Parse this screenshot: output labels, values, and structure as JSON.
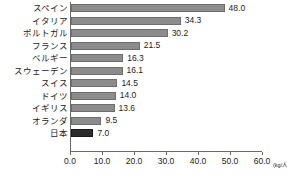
{
  "chart_data": {
    "type": "bar",
    "orientation": "horizontal",
    "title": "",
    "subtitle": "",
    "xlabel": "",
    "ylabel": "",
    "unit_label": "(kg/人/年)",
    "categories": [
      "スペイン",
      "イタリア",
      "ポルトガル",
      "フランス",
      "ベルギー",
      "スウェーデン",
      "スイス",
      "ドイツ",
      "イギリス",
      "オランダ",
      "日本"
    ],
    "values": [
      48.0,
      34.3,
      30.2,
      21.5,
      16.3,
      16.1,
      14.5,
      14.0,
      13.6,
      9.5,
      7.0
    ],
    "value_labels": [
      "48.0",
      "34.3",
      "30.2",
      "21.5",
      "16.3",
      "16.1",
      "14.5",
      "14.0",
      "13.6",
      "9.5",
      "7.0"
    ],
    "highlight_category": "日本",
    "xlim": [
      0,
      60
    ],
    "xticks": [
      0,
      10,
      20,
      30,
      40,
      50,
      60
    ],
    "xtick_labels": [
      "0.0",
      "10.0",
      "20.0",
      "30.0",
      "40.0",
      "50.0",
      "60.0"
    ],
    "grid": false,
    "legend": null,
    "colors": {
      "bar": "#8c8c8c",
      "bar_border": "#6e6e6e",
      "highlight_bar": "#2b2b2b",
      "highlight_border": "#1a1a1a",
      "axis": "#6a6a6a",
      "text": "#1c1c1c",
      "background": "#ffffff"
    }
  }
}
